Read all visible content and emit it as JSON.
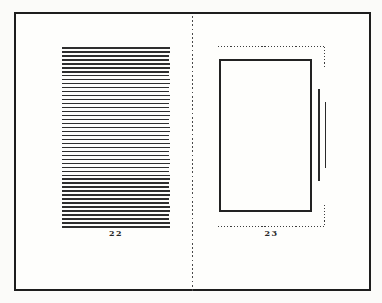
{
  "figure": {
    "kind": "book-spread-diagram",
    "left_page": {
      "page_number": "22",
      "text_line_count": 46
    },
    "right_page": {
      "page_number": "23"
    },
    "colors": {
      "ink": "#1d1d1d",
      "paper": "#fefefc",
      "background": "#fbfbf9"
    }
  }
}
